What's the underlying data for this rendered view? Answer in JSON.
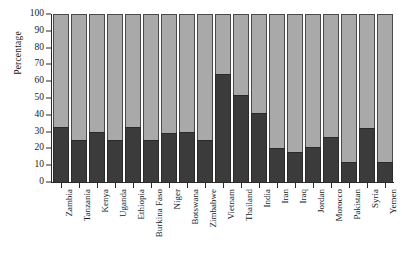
{
  "chart_data": {
    "type": "bar",
    "stacked": true,
    "title": "",
    "subtitle": "",
    "xlabel": "",
    "ylabel": "Percentage",
    "ylim": [
      0,
      100
    ],
    "yticks": [
      0,
      10,
      20,
      30,
      40,
      50,
      60,
      70,
      80,
      90,
      100
    ],
    "grid": false,
    "legend": "none",
    "categories": [
      "Zambia",
      "Tanzania",
      "Kenya",
      "Uganda",
      "Ethiopia",
      "Burkina Faso",
      "Niger",
      "Botswana",
      "Zimbabwe",
      "Vietnam",
      "Thailand",
      "India",
      "Iran",
      "Iraq",
      "Jordan",
      "Morocco",
      "Pakistan",
      "Syria",
      "Yemen"
    ],
    "series": [
      {
        "name": "lower-dark-segment",
        "color": "#3b3b3b",
        "values": [
          33,
          25,
          30,
          25,
          33,
          25,
          29,
          30,
          25,
          64,
          52,
          41,
          20,
          18,
          21,
          27,
          12,
          32,
          12
        ]
      },
      {
        "name": "upper-light-segment",
        "color": "#a9a9a9",
        "values": [
          67,
          75,
          70,
          75,
          67,
          75,
          71,
          70,
          75,
          36,
          48,
          59,
          80,
          82,
          79,
          73,
          88,
          68,
          88
        ]
      }
    ]
  },
  "axis": {
    "y_title": "Percentage"
  }
}
